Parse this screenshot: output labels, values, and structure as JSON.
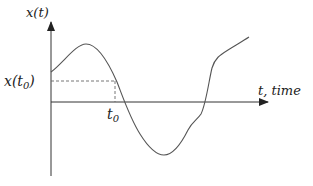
{
  "diagram": {
    "type": "signal-plot",
    "y_axis_label": "x(t)",
    "x_axis_label": "t, time",
    "marked_time_label": "t",
    "marked_time_subscript": "0",
    "marked_value_label_prefix": "x(t",
    "marked_value_label_subscript": "0",
    "marked_value_label_suffix": ")",
    "colors": {
      "axis": "#333333",
      "curve": "#555555",
      "dashed": "#666666",
      "text": "#222222"
    }
  }
}
